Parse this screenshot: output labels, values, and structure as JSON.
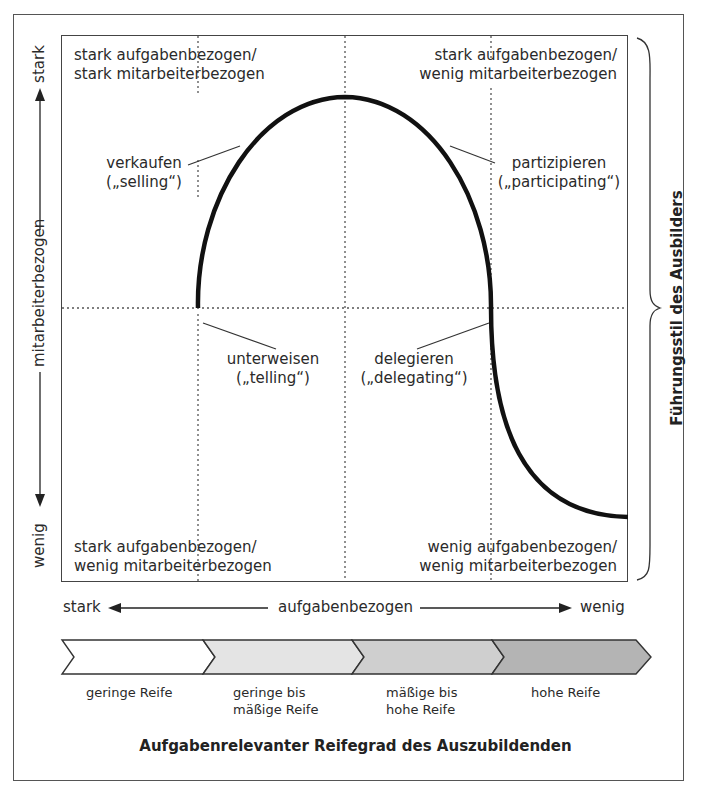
{
  "diagram": {
    "title_x_axis": "Aufgabenrelevanter Reifegrad des Auszubildenden",
    "title_y_axis_right": "Führungsstil des Ausbilders",
    "y_axis": {
      "label": "mitarbeiterbezogen",
      "top": "stark",
      "bottom": "wenig"
    },
    "x_axis": {
      "label": "aufgabenbezogen",
      "left": "stark",
      "right": "wenig"
    },
    "quadrant_corners": {
      "top_left": [
        "stark aufgabenbezogen/",
        "stark mitarbeiterbezogen"
      ],
      "top_right": [
        "stark aufgabenbezogen/",
        "wenig mitarbeiterbezogen"
      ],
      "bottom_left": [
        "stark aufgabenbezogen/",
        "wenig mitarbeiterbezogen"
      ],
      "bottom_right": [
        "wenig aufgabenbezogen/",
        "wenig mitarbeiterbezogen"
      ]
    },
    "styles": [
      {
        "id": "selling",
        "line1": "verkaufen",
        "line2": "(„selling“)"
      },
      {
        "id": "participating",
        "line1": "partizipieren",
        "line2": "(„participating“)"
      },
      {
        "id": "telling",
        "line1": "unterweisen",
        "line2": "(„telling“)"
      },
      {
        "id": "delegating",
        "line1": "delegieren",
        "line2": "(„delegating“)"
      }
    ],
    "maturity_stages": [
      {
        "line1": "geringe Reife",
        "line2": "",
        "fill": "#ffffff"
      },
      {
        "line1": "geringe bis",
        "line2": "mäßige Reife",
        "fill": "#e4e4e4"
      },
      {
        "line1": "mäßige bis",
        "line2": "hohe Reife",
        "fill": "#cfcfcf"
      },
      {
        "line1": "hohe Reife",
        "line2": "",
        "fill": "#b4b4b4"
      }
    ],
    "colors": {
      "curve": "#111111",
      "frame": "#444444",
      "dotted_grid": "#555555"
    }
  }
}
